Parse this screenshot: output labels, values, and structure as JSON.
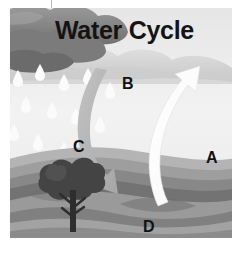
{
  "diagram": {
    "title": "Water Cycle",
    "style": "grayscale illustration",
    "labels": [
      {
        "id": "A",
        "text": "A",
        "refers_to": "evaporation-arrow",
        "x": 212,
        "y": 157
      },
      {
        "id": "B",
        "text": "B",
        "refers_to": "condensation-cloud",
        "x": 128,
        "y": 83
      },
      {
        "id": "C",
        "text": "C",
        "refers_to": "precipitation-arrow",
        "x": 79,
        "y": 146
      },
      {
        "id": "D",
        "text": "D",
        "refers_to": "ground-collection",
        "x": 149,
        "y": 226
      }
    ],
    "elements": {
      "dark_cloud": "dark-storm-cloud",
      "light_cloud_band": "light-cloud-band",
      "raindrops": "falling-raindrops",
      "up_arrow": "white-curved-up-arrow",
      "down_arrow": "gray-curved-down-arrow",
      "tree": "dark-tree",
      "hills": "layered-rolling-hills"
    },
    "colors": {
      "sky": "#efefef",
      "dark_cloud": "#8d8d8d",
      "dark_cloud_shadow": "#6f6f6f",
      "light_cloud": "#d3d3d3",
      "raindrop": "#fbfbfb",
      "up_arrow": "#ffffff",
      "down_arrow": "#b4b4b4",
      "tree": "#3c3c3c",
      "hill_light": "#b0b0b0",
      "hill_mid": "#8e8e8e",
      "hill_dark": "#6a6a6a",
      "hill_darkest": "#4f4f4f",
      "label_text": "#111111",
      "background": "#ffffff"
    }
  }
}
